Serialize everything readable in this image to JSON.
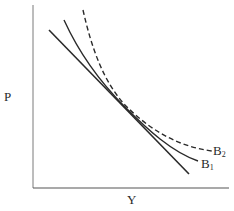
{
  "diagram": {
    "axes": {
      "y_label": "P",
      "x_label": "Y"
    },
    "curves": [
      {
        "id": "tangent-line",
        "style": "solid-straight",
        "label": ""
      },
      {
        "id": "B1",
        "style": "solid-curve",
        "label_main": "B",
        "label_sub": "1"
      },
      {
        "id": "B2",
        "style": "dashed-curve",
        "label_main": "B",
        "label_sub": "2"
      }
    ],
    "colors": {
      "ink": "#2a2a2a",
      "axis": "#6a6a6a",
      "background": "#ffffff"
    }
  }
}
